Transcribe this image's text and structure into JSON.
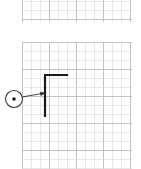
{
  "document": {
    "title": "Grid Drawing",
    "background_color": "#ffffff",
    "width": 141,
    "height": 169
  },
  "style": {
    "grid_minor_color": "#d8d8d8",
    "grid_major_color": "#bdbdbd",
    "grid_minor_width": 0.6,
    "grid_major_width": 0.9,
    "geometry_color": "#1a1a1a",
    "geometry_width": 2.2,
    "leader_color": "#2b2b2b",
    "leader_width": 0.9,
    "balloon_stroke_color": "#3a3a3a",
    "balloon_fill_color": "#ffffff",
    "balloon_dot_color": "#1a1a1a"
  },
  "panels": [
    {
      "name": "top-grid-panel",
      "x": 22,
      "y": -8,
      "width": 110,
      "height": 30,
      "cell": 9,
      "major_every": 3,
      "label": "Top grid panel"
    },
    {
      "name": "main-grid-panel",
      "x": 22,
      "y": 42,
      "width": 110,
      "height": 130,
      "cell": 9,
      "major_every": 3,
      "label": "Main grid panel"
    }
  ],
  "geometry": {
    "name": "L-shaped profile",
    "type": "polyline",
    "points": [
      {
        "x": 67,
        "y": 75
      },
      {
        "x": 45,
        "y": 75
      },
      {
        "x": 45,
        "y": 116
      }
    ],
    "segments": [
      {
        "name": "horizontal-arm",
        "from": [
          67,
          75
        ],
        "to": [
          45,
          75
        ],
        "length_cells": 2.4
      },
      {
        "name": "vertical-stem",
        "from": [
          45,
          75
        ],
        "to": [
          45,
          116
        ],
        "length_cells": 4.6
      }
    ]
  },
  "callout": {
    "name": "balloon-callout",
    "balloon": {
      "center_x": 14,
      "center_y": 99,
      "radius": 8.5,
      "inner_dot_x": 14,
      "inner_dot_y": 99,
      "inner_dot_radius": 1.8,
      "text": ""
    },
    "leader": {
      "from_x": 22,
      "from_y": 97,
      "to_x": 45,
      "to_y": 93
    },
    "arrowhead": {
      "tip_x": 45,
      "tip_y": 93,
      "size": 4.5
    }
  }
}
